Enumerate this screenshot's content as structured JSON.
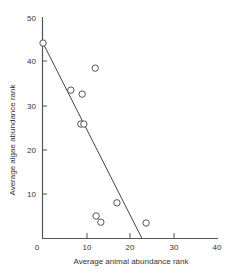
{
  "chart_data": {
    "type": "scatter",
    "title": "",
    "xlabel": "Average animal abundance rank",
    "ylabel": "Average algae abundance rank",
    "xlim": [
      0,
      40
    ],
    "ylim": [
      0,
      50
    ],
    "x_ticks": [
      0,
      10,
      20,
      30,
      40
    ],
    "y_ticks": [
      10,
      20,
      30,
      40,
      50
    ],
    "grid": false,
    "legend": null,
    "series": [
      {
        "name": "sites",
        "marker": "open-circle",
        "points": [
          {
            "x": 0.0,
            "y": 44.3
          },
          {
            "x": 6.4,
            "y": 33.6
          },
          {
            "x": 9.0,
            "y": 32.7
          },
          {
            "x": 12.0,
            "y": 38.6
          },
          {
            "x": 8.7,
            "y": 25.9
          },
          {
            "x": 9.4,
            "y": 25.9
          },
          {
            "x": 17.0,
            "y": 8.0
          },
          {
            "x": 12.2,
            "y": 5.0
          },
          {
            "x": 13.3,
            "y": 3.6
          },
          {
            "x": 23.7,
            "y": 3.4
          }
        ]
      }
    ],
    "fit_line": {
      "type": "linear",
      "from": {
        "x": 0.0,
        "y": 44.3
      },
      "to": {
        "x": 22.7,
        "y": 0.0
      }
    }
  },
  "labels": {
    "x_title": "Average animal abundance rank",
    "y_title": "Average algae abundance rank",
    "x_tick_0": "0",
    "x_tick_10": "10",
    "x_tick_20": "20",
    "x_tick_30": "30",
    "x_tick_40": "40",
    "y_tick_10": "10",
    "y_tick_20": "20",
    "y_tick_30": "30",
    "y_tick_40": "40",
    "y_tick_50": "50"
  }
}
